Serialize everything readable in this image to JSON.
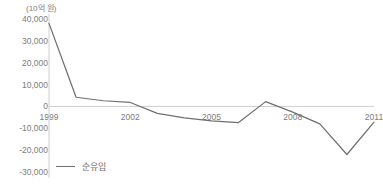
{
  "chart_data": {
    "type": "line",
    "title": "",
    "unit_label": "(10억 원)",
    "xlabel": "",
    "ylabel": "",
    "grid": false,
    "legend_position": "bottom-left",
    "x": [
      1999,
      2000,
      2001,
      2002,
      2003,
      2004,
      2005,
      2006,
      2007,
      2008,
      2009,
      2010,
      2011
    ],
    "xlim": [
      1999,
      2011
    ],
    "ylim": [
      -30000,
      40000
    ],
    "xticks": [
      "1999",
      "2002",
      "2005",
      "2008",
      "2011"
    ],
    "xtick_values": [
      1999,
      2002,
      2005,
      2008,
      2011
    ],
    "yticks": [
      "40,000",
      "30,000",
      "20,000",
      "10,000",
      "0",
      "-10,000",
      "-20,000",
      "-30,000"
    ],
    "ytick_values": [
      40000,
      30000,
      20000,
      10000,
      0,
      -10000,
      -20000,
      -30000
    ],
    "series": [
      {
        "name": "순유입",
        "color": "#6f6f6f",
        "values": [
          38000,
          4200,
          2600,
          1800,
          -3200,
          -5200,
          -6600,
          -7400,
          2200,
          -2600,
          -8000,
          -22000,
          -7200
        ]
      }
    ]
  }
}
